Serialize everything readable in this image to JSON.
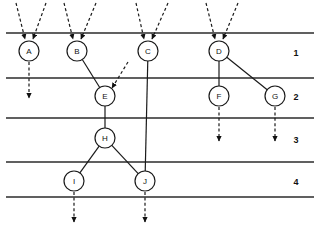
{
  "diagram": {
    "canvas": {
      "width": 316,
      "height": 227
    },
    "style": {
      "line_color": "#2b2b2b",
      "node_stroke": "#1a1a1a",
      "node_fill": "#ffffff",
      "background": "#ffffff",
      "node_radius": 10
    },
    "level_lines": [
      {
        "name": "line-top",
        "y": 33
      },
      {
        "name": "line-1-2",
        "y": 78
      },
      {
        "name": "line-2-3",
        "y": 118
      },
      {
        "name": "line-3-4",
        "y": 162
      },
      {
        "name": "line-bottom",
        "y": 197
      }
    ],
    "level_numbers": [
      {
        "label": "1",
        "x": 296,
        "y": 53
      },
      {
        "label": "2",
        "x": 296,
        "y": 97
      },
      {
        "label": "3",
        "x": 296,
        "y": 140
      },
      {
        "label": "4",
        "x": 296,
        "y": 182
      }
    ],
    "nodes": [
      {
        "id": "A",
        "label": "A",
        "x": 29,
        "y": 51,
        "level": 1
      },
      {
        "id": "B",
        "label": "B",
        "x": 77,
        "y": 51,
        "level": 1
      },
      {
        "id": "C",
        "label": "C",
        "x": 148,
        "y": 51,
        "level": 1
      },
      {
        "id": "D",
        "label": "D",
        "x": 219,
        "y": 51,
        "level": 1
      },
      {
        "id": "E",
        "label": "E",
        "x": 105,
        "y": 96,
        "level": 2
      },
      {
        "id": "F",
        "label": "F",
        "x": 219,
        "y": 96,
        "level": 2
      },
      {
        "id": "G",
        "label": "G",
        "x": 275,
        "y": 96,
        "level": 2
      },
      {
        "id": "H",
        "label": "H",
        "x": 105,
        "y": 138,
        "level": 3
      },
      {
        "id": "I",
        "label": "I",
        "x": 74,
        "y": 181,
        "level": 4
      },
      {
        "id": "J",
        "label": "J",
        "x": 145,
        "y": 181,
        "level": 4
      }
    ],
    "edges": [
      {
        "name": "edge-B-E",
        "from": "B",
        "to": "E"
      },
      {
        "name": "edge-D-F",
        "from": "D",
        "to": "F"
      },
      {
        "name": "edge-D-G",
        "from": "D",
        "to": "G"
      },
      {
        "name": "edge-E-H",
        "from": "E",
        "to": "H"
      },
      {
        "name": "edge-H-I",
        "from": "H",
        "to": "I"
      },
      {
        "name": "edge-H-J",
        "from": "H",
        "to": "J"
      },
      {
        "name": "edge-C-J",
        "from": "C",
        "to": "J"
      }
    ],
    "input_arrows": [
      {
        "name": "input-A-left",
        "x1": 16,
        "y1": 3,
        "x2": 25,
        "y2": 39
      },
      {
        "name": "input-A-right",
        "x1": 46,
        "y1": 3,
        "x2": 33,
        "y2": 39
      },
      {
        "name": "input-B-left",
        "x1": 64,
        "y1": 3,
        "x2": 73,
        "y2": 39
      },
      {
        "name": "input-B-right",
        "x1": 96,
        "y1": 3,
        "x2": 81,
        "y2": 39
      },
      {
        "name": "input-C-left",
        "x1": 136,
        "y1": 3,
        "x2": 144,
        "y2": 39
      },
      {
        "name": "input-C-right",
        "x1": 168,
        "y1": 3,
        "x2": 152,
        "y2": 39
      },
      {
        "name": "input-D-left",
        "x1": 206,
        "y1": 3,
        "x2": 215,
        "y2": 39
      },
      {
        "name": "input-D-right",
        "x1": 238,
        "y1": 3,
        "x2": 223,
        "y2": 39
      },
      {
        "name": "input-E-right",
        "x1": 128,
        "y1": 62,
        "x2": 112,
        "y2": 88
      }
    ],
    "output_arrows": [
      {
        "name": "output-A",
        "x1": 29,
        "y1": 62,
        "x2": 29,
        "y2": 98
      },
      {
        "name": "output-F",
        "x1": 219,
        "y1": 107,
        "x2": 219,
        "y2": 141
      },
      {
        "name": "output-G",
        "x1": 275,
        "y1": 107,
        "x2": 275,
        "y2": 141
      },
      {
        "name": "output-I",
        "x1": 74,
        "y1": 192,
        "x2": 74,
        "y2": 222
      },
      {
        "name": "output-J",
        "x1": 145,
        "y1": 192,
        "x2": 145,
        "y2": 222
      }
    ]
  }
}
